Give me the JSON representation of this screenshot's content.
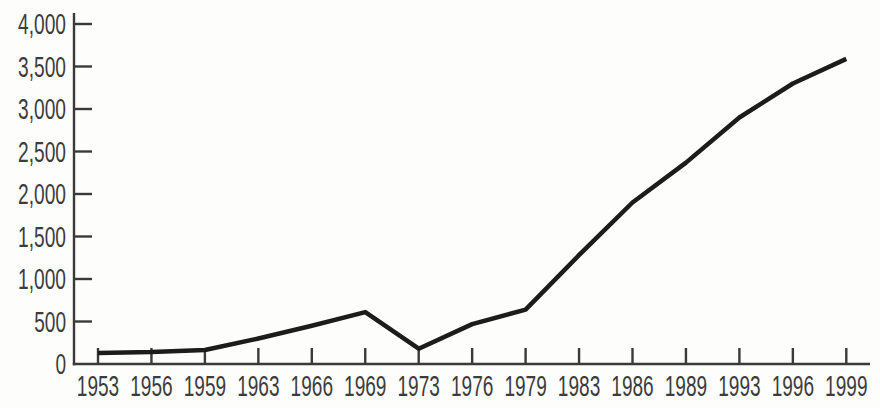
{
  "chart_data": {
    "type": "line",
    "title": "",
    "subtitle": "",
    "xlabel": "",
    "ylabel": "",
    "categories": [
      "1953",
      "1956",
      "1959",
      "1963",
      "1966",
      "1969",
      "1973",
      "1976",
      "1979",
      "1983",
      "1986",
      "1989",
      "1993",
      "1996",
      "1999"
    ],
    "series": [
      {
        "name": "value",
        "values": [
          130,
          140,
          165,
          300,
          450,
          610,
          180,
          470,
          640,
          1280,
          1900,
          2370,
          2900,
          3300,
          3590
        ]
      }
    ],
    "ylim": [
      0,
      4000
    ],
    "y_tick_step": 500,
    "y_tick_values": [
      0,
      500,
      1000,
      1500,
      2000,
      2500,
      3000,
      3500,
      4000
    ],
    "y_tick_labels": [
      "0",
      "500",
      "1,000",
      "1,500",
      "2,000",
      "2,500",
      "3,000",
      "3,500",
      "4,000"
    ],
    "grid": false,
    "legend": false,
    "legend_position": "none",
    "colors": {
      "background": "#fdfdfc",
      "line": "#1c1c1c",
      "axis": "#3a3a3a",
      "tick": "#3a3a3a",
      "label": "#3c3c3c"
    }
  }
}
